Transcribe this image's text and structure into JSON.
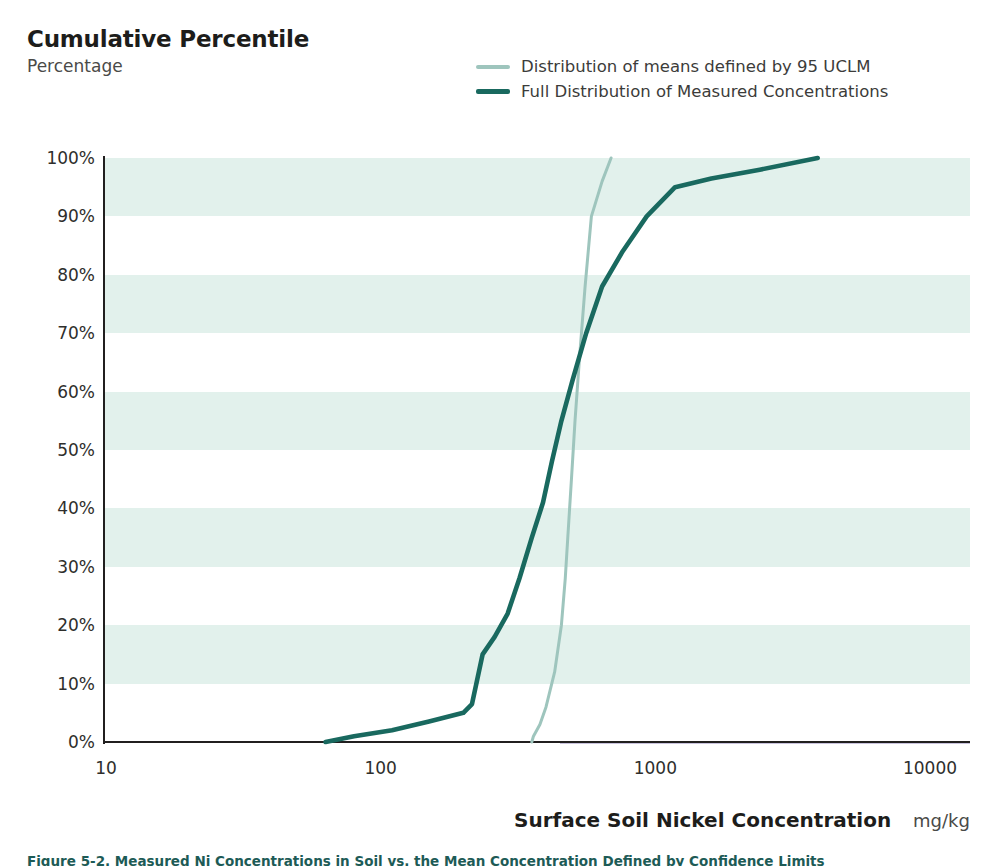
{
  "header": {
    "title": "Cumulative Percentile",
    "subtitle": "Percentage"
  },
  "legend": {
    "position": "top-right",
    "items": [
      {
        "label": "Distribution of means defined by 95 UCLM",
        "color": "#9ec5bd",
        "name": "series-uclm"
      },
      {
        "label": "Full Distribution of Measured Concentrations",
        "color": "#19695f",
        "name": "series-full"
      }
    ]
  },
  "axes": {
    "x": {
      "title": "Surface Soil Nickel Concentration",
      "units": "mg/kg",
      "scale": "log",
      "ticks": [
        "10",
        "100",
        "1000",
        "10000"
      ],
      "tick_values": [
        10,
        100,
        1000,
        10000
      ],
      "range": [
        10,
        10000
      ]
    },
    "y": {
      "title": "Cumulative Percentile",
      "units": "Percentage",
      "ticks": [
        "0%",
        "10%",
        "20%",
        "30%",
        "40%",
        "50%",
        "60%",
        "70%",
        "80%",
        "90%",
        "100%"
      ],
      "tick_values": [
        0,
        10,
        20,
        30,
        40,
        50,
        60,
        70,
        80,
        90,
        100
      ],
      "range": [
        0,
        100
      ]
    }
  },
  "style": {
    "band_color": "#e2f1ec",
    "background": "#ffffff",
    "axis_color": "#211f1f",
    "caption_color": "#1d5b56"
  },
  "caption": "Figure 5-2.  Measured Ni Concentrations in Soil vs. the Mean Concentration Defined by Confidence Limits",
  "chart_data": {
    "type": "line",
    "title": "Cumulative Percentile",
    "subtitle": "Percentage",
    "xlabel": "Surface Soil Nickel Concentration",
    "xunits": "mg/kg",
    "ylabel": "Percentage",
    "xscale": "log",
    "xlim": [
      10,
      10000
    ],
    "ylim": [
      0,
      100
    ],
    "grid": "horizontal-bands",
    "legend_position": "top-right",
    "series": [
      {
        "name": "Distribution of means defined by 95 UCLM",
        "color": "#9ec5bd",
        "x": [
          355,
          360,
          380,
          400,
          430,
          455,
          470,
          480,
          495,
          510,
          530,
          555,
          585,
          640,
          690
        ],
        "y": [
          0,
          1,
          3,
          6,
          12,
          20,
          28,
          35,
          45,
          55,
          66,
          78,
          90,
          96,
          100
        ]
      },
      {
        "name": "Full Distribution of Measured Concentrations",
        "color": "#19695f",
        "x": [
          63,
          80,
          110,
          150,
          200,
          215,
          235,
          260,
          290,
          320,
          355,
          390,
          420,
          455,
          500,
          560,
          640,
          760,
          930,
          1180,
          1600,
          2400,
          3900
        ],
        "y": [
          0,
          1,
          2,
          3.5,
          5,
          6.5,
          15,
          18,
          22,
          28,
          35,
          41,
          48,
          55,
          62,
          70,
          78,
          84,
          90,
          95,
          96.5,
          98,
          100
        ]
      }
    ]
  }
}
